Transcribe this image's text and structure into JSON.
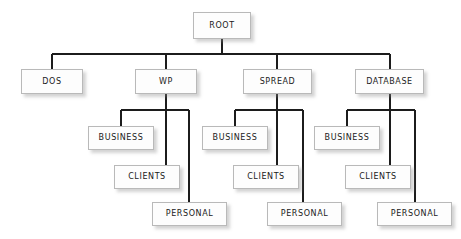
{
  "diagram": {
    "type": "tree",
    "style": {
      "background": "#ffffff",
      "box_fill": "#fdfdfd",
      "box_border": "#b9b9b9",
      "line_color": "#1c1c1c",
      "text_color": "#1a1a1a",
      "shadow_color": "#8c8c8c"
    },
    "nodes": {
      "root": {
        "label": "ROOT",
        "x": 193,
        "y": 12,
        "w": 58,
        "h": 27
      },
      "dos": {
        "label": "DOS",
        "x": 21,
        "y": 69,
        "w": 62,
        "h": 25
      },
      "wp": {
        "label": "WP",
        "x": 135,
        "y": 69,
        "w": 62,
        "h": 25
      },
      "spread": {
        "label": "SPREAD",
        "x": 243,
        "y": 69,
        "w": 69,
        "h": 25
      },
      "database": {
        "label": "DATABASE",
        "x": 355,
        "y": 69,
        "w": 69,
        "h": 25
      },
      "wp_business": {
        "label": "BUSINESS",
        "x": 88,
        "y": 126,
        "w": 66,
        "h": 24
      },
      "wp_clients": {
        "label": "CLIENTS",
        "x": 114,
        "y": 165,
        "w": 66,
        "h": 24
      },
      "wp_personal": {
        "label": "PERSONAL",
        "x": 152,
        "y": 202,
        "w": 75,
        "h": 24
      },
      "spread_business": {
        "label": "BUSINESS",
        "x": 202,
        "y": 126,
        "w": 66,
        "h": 24
      },
      "spread_clients": {
        "label": "CLIENTS",
        "x": 233,
        "y": 165,
        "w": 66,
        "h": 24
      },
      "spread_personal": {
        "label": "PERSONAL",
        "x": 267,
        "y": 202,
        "w": 75,
        "h": 24
      },
      "database_business": {
        "label": "BUSINESS",
        "x": 314,
        "y": 126,
        "w": 66,
        "h": 24
      },
      "database_clients": {
        "label": "CLIENTS",
        "x": 345,
        "y": 165,
        "w": 66,
        "h": 24
      },
      "database_personal": {
        "label": "PERSONAL",
        "x": 377,
        "y": 202,
        "w": 75,
        "h": 24
      }
    },
    "edges": [
      {
        "from": "root",
        "to": "dos"
      },
      {
        "from": "root",
        "to": "wp"
      },
      {
        "from": "root",
        "to": "spread"
      },
      {
        "from": "root",
        "to": "database"
      },
      {
        "from": "wp",
        "to": "wp_business"
      },
      {
        "from": "wp",
        "to": "wp_clients"
      },
      {
        "from": "wp",
        "to": "wp_personal"
      },
      {
        "from": "spread",
        "to": "spread_business"
      },
      {
        "from": "spread",
        "to": "spread_clients"
      },
      {
        "from": "spread",
        "to": "spread_personal"
      },
      {
        "from": "database",
        "to": "database_business"
      },
      {
        "from": "database",
        "to": "database_clients"
      },
      {
        "from": "database",
        "to": "database_personal"
      }
    ]
  }
}
